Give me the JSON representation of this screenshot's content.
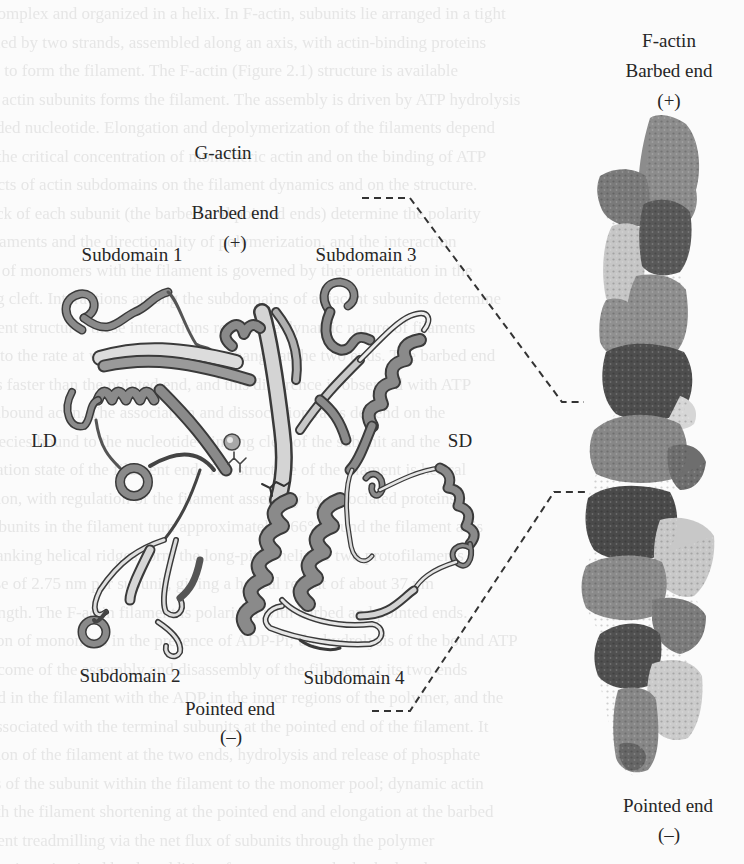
{
  "figure": {
    "g_actin": {
      "title": "G-actin",
      "barbed_end": "Barbed end",
      "barbed_sign": "(+)",
      "pointed_end": "Pointed end",
      "pointed_sign": "(–)",
      "subdomains": [
        "Subdomain 1",
        "Subdomain 2",
        "Subdomain 3",
        "Subdomain 4"
      ],
      "domains": {
        "left": "LD",
        "right": "SD"
      }
    },
    "f_actin": {
      "title": "F-actin",
      "barbed_end": "Barbed end",
      "barbed_sign": "(+)",
      "pointed_end": "Pointed end",
      "pointed_sign": "(–)"
    },
    "colors": {
      "background": "#fbfbfb",
      "ribbon": "#8a8a8a",
      "ribbon_dark": "#3a3a3a",
      "ribbon_light": "#d8d8d8",
      "filament_dark": "#5e5e5e",
      "filament_mid": "#8c8c8c",
      "filament_light": "#c8c8c8",
      "dashes": "#333333"
    }
  },
  "bleed_through_lines": [
    "complex and organized in a helix. In F-actin, subunits lie arranged in a tight",
    "led by two strands, assembled along an axis, with actin-binding proteins",
    "ed to form the filament. The F-actin (Figure 2.1) structure is available",
    "e actin subunits forms the filament. The assembly is driven by ATP hydrolysis",
    "ded nucleotide. Elongation and depolymerization of the filaments depend",
    "n the critical concentration of monomeric actin and on the binding of ATP",
    "ects of actin subdomains on the filament dynamics and on the structure.",
    "ck of each subunit (the barbed and pointed ends) determine the polarity",
    "filaments and the directionality of polymerization, and the interaction",
    "e of monomers with the filament is governed by their orientation in the",
    "g cleft. Interactions among the subdomains of adjacent subunits determine",
    "ment structure; these interactions reveal the dynamic nature of filaments",
    "r to the rate at which monomers exchange at the two ends. The barbed end",
    "s faster than the pointed end, and this difference is observed with ATP",
    "unbound actin. The association and dissociation rates depend on the",
    "pecies bound to the nucleotide-binding cleft of the subunit and the",
    "ation state of the filament end. The structure of the filament is helical",
    "ation, with regulation of the filament assembly by associated proteins",
    "ubunits in the filament turn approximately 166° around the filament axis",
    "anking helical ridges form the long-pitch helix of two protofilaments",
    "rise of 2.75 nm per subunit, giving a helical repeat of about 37 nm",
    "ength. The F-actin filament is polarized with barbed and pointed ends.",
    "on of monomers in the presence of ADP-Pi; the hydrolysis of the bound ATP",
    "utcome of the assembly and disassembly of the filament at its two ends",
    "ed in the filament with the ADP in the inner regions of the polymer, and the",
    "ssociated with the terminal subunits at the pointed end of the filament. It",
    "ation of the filament at the two ends, hydrolysis and release of phosphate",
    "ts of the subunit within the filament to the monomer pool; dynamic actin",
    "th the filament shortening at the pointed end and elongation at the barbed",
    "ment treadmilling via the net flux of subunits through the polymer",
    "ent is maintained by the addition of monomers at the barbed end"
  ]
}
